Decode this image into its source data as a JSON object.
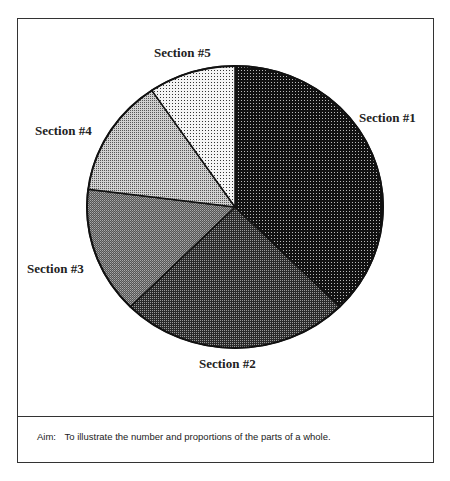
{
  "chart_data": {
    "type": "pie",
    "title": "",
    "start_angle_deg": 0,
    "direction": "clockwise",
    "categories": [
      "Section #1",
      "Section #2",
      "Section #3",
      "Section #4",
      "Section #5"
    ],
    "values": [
      37.5,
      25,
      14.5,
      13.5,
      9.5
    ],
    "units": "percent (estimated from slice angles)",
    "fills": [
      "#1e1e1e",
      "#4a4a4a",
      "#6e6e6e",
      "#a8a8a8",
      "#e2e2e2"
    ],
    "legend": "none (direct labels)"
  },
  "labels": {
    "s1": "Section #1",
    "s2": "Section #2",
    "s3": "Section #3",
    "s4": "Section #4",
    "s5": "Section #5"
  },
  "caption": {
    "prefix": "Aim:",
    "text": "To illustrate the number and proportions of the parts of a whole."
  }
}
